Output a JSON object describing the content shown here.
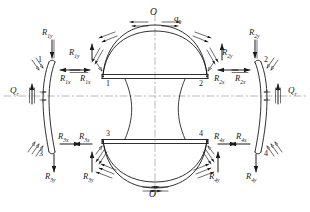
{
  "diagram": {
    "axis_labels": {
      "top": "O",
      "bottom": "O'"
    },
    "distributed_load": {
      "symbol": "q",
      "subscript": "0"
    },
    "edge_loads": {
      "left": {
        "symbol": "Q",
        "subscript": "r"
      },
      "right": {
        "symbol": "Q",
        "subscript": "r"
      }
    },
    "nodes": [
      {
        "id": "1",
        "label": "1",
        "position": "upper-left"
      },
      {
        "id": "2",
        "label": "2",
        "position": "upper-right"
      },
      {
        "id": "3",
        "label": "3",
        "position": "lower-left"
      },
      {
        "id": "4",
        "label": "4",
        "position": "lower-right"
      },
      {
        "id": "1b",
        "label": "1",
        "position": "upper-left-outer"
      },
      {
        "id": "2b",
        "label": "2",
        "position": "upper-right-outer"
      },
      {
        "id": "3b",
        "label": "3",
        "position": "lower-left-outer"
      },
      {
        "id": "4b",
        "label": "4",
        "position": "lower-right-outer"
      }
    ],
    "reactions": [
      {
        "id": "R1y-outer",
        "symbol": "R",
        "subscript": "1y",
        "direction": "down"
      },
      {
        "id": "R1x-outer",
        "symbol": "R",
        "subscript": "1x",
        "direction": "left"
      },
      {
        "id": "R1y-inner",
        "symbol": "R",
        "subscript": "1y",
        "direction": "up"
      },
      {
        "id": "R1x-inner",
        "symbol": "R",
        "subscript": "1x",
        "direction": "right"
      },
      {
        "id": "R2y-inner",
        "symbol": "R",
        "subscript": "2y",
        "direction": "up"
      },
      {
        "id": "R2x-inner",
        "symbol": "R",
        "subscript": "2x",
        "direction": "left"
      },
      {
        "id": "R2x-outer",
        "symbol": "R",
        "subscript": "2x",
        "direction": "right"
      },
      {
        "id": "R2y-outer",
        "symbol": "R",
        "subscript": "2y",
        "direction": "down"
      },
      {
        "id": "R3x-outer",
        "symbol": "R",
        "subscript": "3x",
        "direction": "right"
      },
      {
        "id": "R3y-outer",
        "symbol": "R",
        "subscript": "3y",
        "direction": "down"
      },
      {
        "id": "R3x-inner",
        "symbol": "R",
        "subscript": "3x",
        "direction": "left"
      },
      {
        "id": "R3y-inner",
        "symbol": "R",
        "subscript": "3y",
        "direction": "up"
      },
      {
        "id": "R4x-inner",
        "symbol": "R",
        "subscript": "4x",
        "direction": "right"
      },
      {
        "id": "R4y-inner",
        "symbol": "R",
        "subscript": "4y",
        "direction": "up"
      },
      {
        "id": "R4x-outer",
        "symbol": "R",
        "subscript": "4x",
        "direction": "left"
      },
      {
        "id": "R4y-outer",
        "symbol": "R",
        "subscript": "4y",
        "direction": "down"
      }
    ],
    "colors": {
      "line": "#1a1a1a",
      "centerline": "#8a8a8a",
      "background": "#ffffff"
    }
  }
}
